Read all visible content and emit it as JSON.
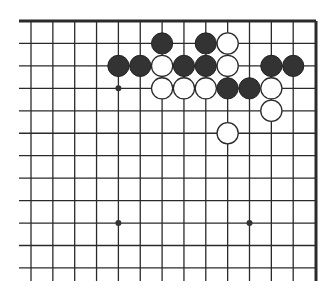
{
  "diagram": {
    "type": "go-board-fragment",
    "region": "top-right corner",
    "board_size": 19,
    "columns_shown": 14,
    "rows_shown": 12,
    "edges": [
      "top",
      "right"
    ],
    "colors": {
      "line": "#2a2a2a",
      "black_stone": "#333333",
      "white_stone": "#ffffff",
      "background": "#ffffff"
    },
    "star_points": [
      {
        "col": 4,
        "row": 3
      },
      {
        "col": 4,
        "row": 9
      },
      {
        "col": 10,
        "row": 9
      }
    ],
    "stones": [
      {
        "color": "black",
        "col": 6,
        "row": 1
      },
      {
        "color": "black",
        "col": 8,
        "row": 1
      },
      {
        "color": "white",
        "col": 9,
        "row": 1
      },
      {
        "color": "black",
        "col": 4,
        "row": 2
      },
      {
        "color": "black",
        "col": 5,
        "row": 2
      },
      {
        "color": "white",
        "col": 6,
        "row": 2
      },
      {
        "color": "black",
        "col": 7,
        "row": 2
      },
      {
        "color": "black",
        "col": 8,
        "row": 2
      },
      {
        "color": "white",
        "col": 9,
        "row": 2
      },
      {
        "color": "black",
        "col": 11,
        "row": 2
      },
      {
        "color": "black",
        "col": 12,
        "row": 2
      },
      {
        "color": "white",
        "col": 6,
        "row": 3
      },
      {
        "color": "white",
        "col": 7,
        "row": 3
      },
      {
        "color": "white",
        "col": 8,
        "row": 3
      },
      {
        "color": "black",
        "col": 9,
        "row": 3
      },
      {
        "color": "black",
        "col": 10,
        "row": 3
      },
      {
        "color": "white",
        "col": 11,
        "row": 3
      },
      {
        "color": "white",
        "col": 11,
        "row": 4
      },
      {
        "color": "white",
        "col": 9,
        "row": 5
      }
    ]
  }
}
